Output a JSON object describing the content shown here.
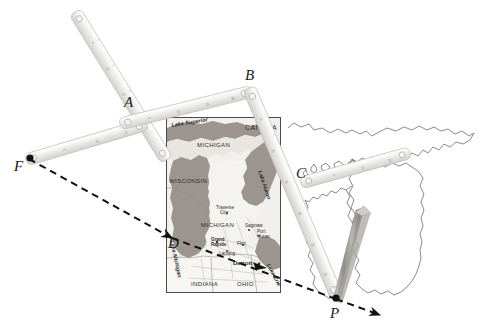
{
  "figure": {
    "type": "pantograph-over-map",
    "background_color": "#ffffff",
    "ink_color": "#1a1a1a"
  },
  "points": [
    {
      "id": "A",
      "label": "A",
      "x": 124,
      "y": 95,
      "has_dot": false
    },
    {
      "id": "B",
      "label": "B",
      "x": 245,
      "y": 68,
      "has_dot": false
    },
    {
      "id": "C",
      "label": "C",
      "x": 296,
      "y": 166,
      "has_dot": false
    },
    {
      "id": "D",
      "label": "D",
      "x": 168,
      "y": 236,
      "has_dot": false
    },
    {
      "id": "F",
      "label": "F",
      "x": 14,
      "y": 159,
      "has_dot": true
    },
    {
      "id": "P",
      "label": "P",
      "x": 330,
      "y": 306,
      "has_dot": true
    }
  ],
  "projection_line": {
    "style": "dashed",
    "color": "#111111",
    "from": "F",
    "through": "D",
    "to": "P",
    "arrowheads": [
      "at-D",
      "beyond-P"
    ]
  },
  "rulers": [
    {
      "name": "ruler-upper-left",
      "from": [
        75,
        12
      ],
      "to": [
        167,
        160
      ]
    },
    {
      "name": "ruler-far-left",
      "from": [
        28,
        157
      ],
      "to": [
        146,
        121
      ]
    },
    {
      "name": "ruler-a-to-b",
      "from": [
        122,
        123
      ],
      "to": [
        250,
        92
      ]
    },
    {
      "name": "ruler-b-to-p",
      "from": [
        248,
        88
      ],
      "to": [
        336,
        297
      ]
    },
    {
      "name": "ruler-c-to-right",
      "from": [
        300,
        182
      ],
      "to": [
        409,
        152
      ]
    },
    {
      "name": "pen-wedge",
      "from": [
        333,
        300
      ],
      "to": [
        370,
        208
      ]
    }
  ],
  "map": {
    "frame": {
      "x": 166,
      "y": 117,
      "width": 113,
      "height": 174
    },
    "labels": {
      "lake_superior": "Lake Superior",
      "canada": "CANADA",
      "michigan_upper": "MICHIGAN",
      "wisconsin": "WISCONSIN",
      "lake_huron": "Lake Huron",
      "michigan_lower": "MICHIGAN",
      "lake_michigan": "Lake Michigan",
      "lake_erie": "Lake Erie",
      "indiana": "INDIANA",
      "ohio": "OHIO",
      "traverse_city": "Traverse City",
      "grand_rapids": "Grand Rapids",
      "lansing": "Lansing",
      "flint": "Flint",
      "saginaw": "Saginaw",
      "port_huron": "Port Huron",
      "detroit": "Detroit"
    },
    "colors": {
      "water": "#a9a29c",
      "land": "#f0eeea",
      "land_shade": "#cfc9c2",
      "border": "#4a4a4a"
    }
  },
  "background_outline": {
    "name": "great-lakes-outline",
    "stroke": "#6d6d6d"
  }
}
